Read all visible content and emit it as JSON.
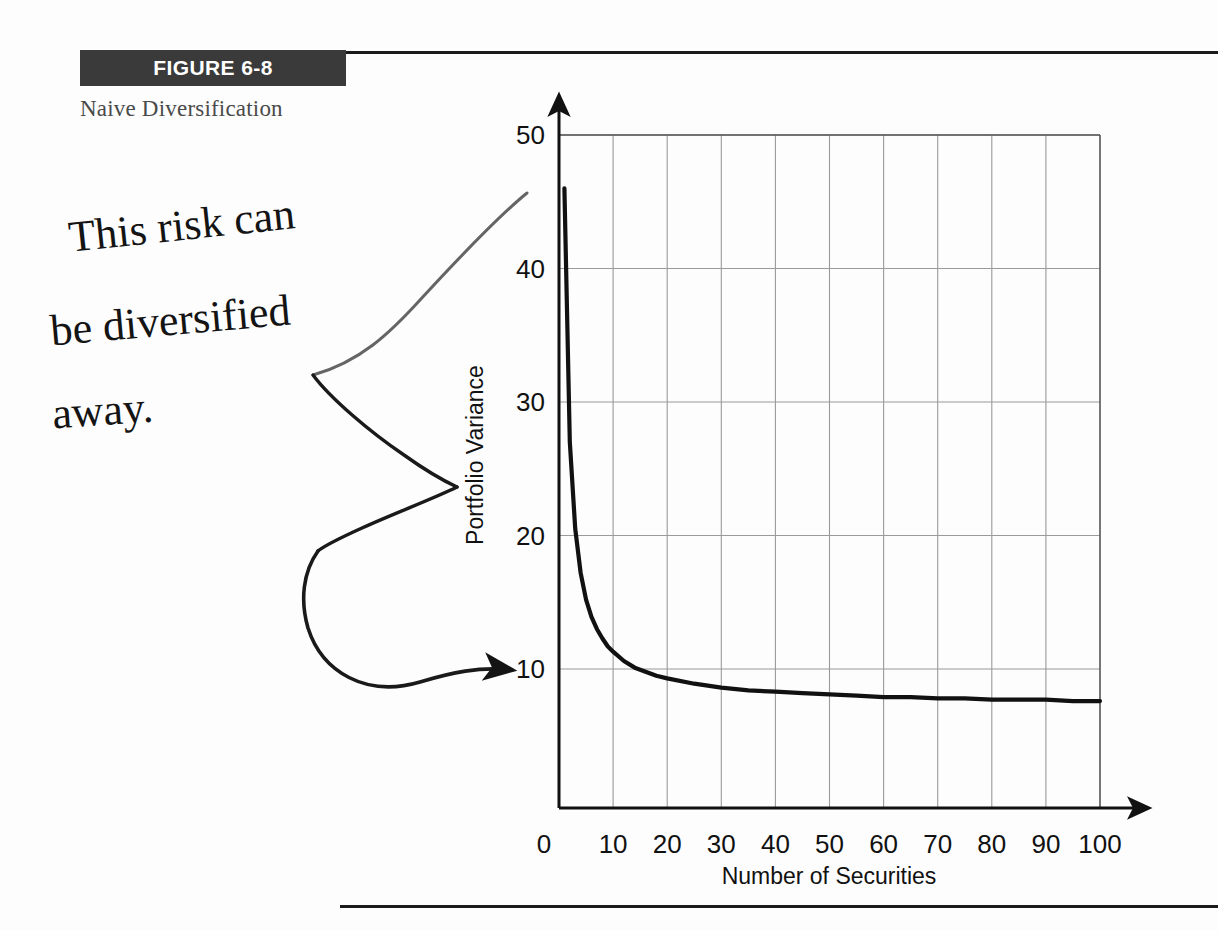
{
  "figure": {
    "badge_label": "FIGURE 6-8",
    "caption": "Naive Diversification",
    "badge_color": "#3a3a3a",
    "rule_color": "#1b1b1b"
  },
  "annotation": {
    "kind": "handwritten-note",
    "line1": "This risk can",
    "line2": "be diversified",
    "line3": "away.",
    "full_text": "This risk can be diversified away.",
    "marker": "hand-drawn bracket arrow pointing to the diversifiable portion of variance",
    "color": "#141414"
  },
  "chart_data": {
    "type": "line",
    "title": "Naive Diversification",
    "xlabel": "Number of Securities",
    "ylabel": "Portfolio Variance",
    "xlim": [
      0,
      100
    ],
    "ylim": [
      0,
      52
    ],
    "xticks": [
      0,
      10,
      20,
      30,
      40,
      50,
      60,
      70,
      80,
      90,
      100
    ],
    "xticklabels": [
      "0",
      "10",
      "20",
      "30",
      "40",
      "50",
      "60",
      "70",
      "80",
      "90",
      "100"
    ],
    "yticks": [
      10,
      20,
      30,
      40,
      50
    ],
    "yticklabels": [
      "10",
      "20",
      "30",
      "40",
      "50"
    ],
    "grid": true,
    "legend": "none",
    "axis_arrows": true,
    "asymptote": 7.5,
    "series": [
      {
        "name": "Portfolio Variance",
        "color": "#111111",
        "x": [
          1,
          2,
          3,
          4,
          5,
          6,
          7,
          8,
          9,
          10,
          12,
          14,
          16,
          18,
          20,
          25,
          30,
          35,
          40,
          45,
          50,
          55,
          60,
          65,
          70,
          75,
          80,
          85,
          90,
          95,
          100
        ],
        "values": [
          46.0,
          27.0,
          20.5,
          17.2,
          15.2,
          13.9,
          13.0,
          12.3,
          11.7,
          11.3,
          10.6,
          10.1,
          9.8,
          9.5,
          9.3,
          8.9,
          8.6,
          8.4,
          8.3,
          8.2,
          8.1,
          8.0,
          7.9,
          7.9,
          7.8,
          7.8,
          7.7,
          7.7,
          7.7,
          7.6,
          7.6
        ]
      }
    ]
  }
}
